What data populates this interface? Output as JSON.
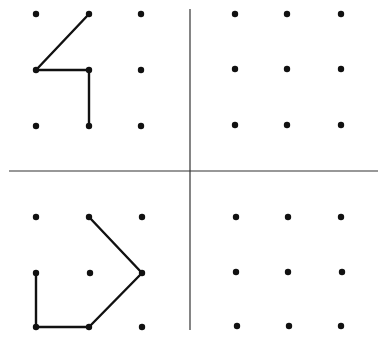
{
  "diagram": {
    "colors": {
      "ink": "#111111",
      "divider": "#333333",
      "background": "#ffffff"
    },
    "dividers": {
      "horizontal": {
        "x1": 9,
        "y": 171,
        "x2": 378
      },
      "vertical": {
        "x": 190,
        "y1": 9,
        "y2": 330
      }
    },
    "quadrants": [
      {
        "id": "top-left",
        "dots": [
          [
            36,
            14
          ],
          [
            89,
            14
          ],
          [
            141,
            14
          ],
          [
            36,
            70
          ],
          [
            89,
            70
          ],
          [
            141,
            70
          ],
          [
            36,
            126
          ],
          [
            89,
            126
          ],
          [
            141,
            126
          ]
        ],
        "segments": [
          [
            89,
            14,
            36,
            70
          ],
          [
            36,
            70,
            89,
            70
          ],
          [
            89,
            70,
            89,
            126
          ]
        ]
      },
      {
        "id": "top-right",
        "dots": [
          [
            235,
            14
          ],
          [
            287,
            14
          ],
          [
            341,
            14
          ],
          [
            235,
            69
          ],
          [
            287,
            69
          ],
          [
            341,
            69
          ],
          [
            235,
            125
          ],
          [
            287,
            125
          ],
          [
            341,
            125
          ]
        ],
        "segments": []
      },
      {
        "id": "bottom-left",
        "dots": [
          [
            36,
            217
          ],
          [
            89,
            217
          ],
          [
            142,
            217
          ],
          [
            36,
            273
          ],
          [
            90,
            273
          ],
          [
            142,
            273
          ],
          [
            36,
            327
          ],
          [
            89,
            327
          ],
          [
            142,
            327
          ]
        ],
        "segments": [
          [
            89,
            217,
            142,
            273
          ],
          [
            142,
            273,
            89,
            327
          ],
          [
            89,
            327,
            36,
            327
          ],
          [
            36,
            327,
            36,
            273
          ]
        ]
      },
      {
        "id": "bottom-right",
        "dots": [
          [
            236,
            217
          ],
          [
            288,
            217
          ],
          [
            341,
            217
          ],
          [
            236,
            272
          ],
          [
            288,
            272
          ],
          [
            342,
            272
          ],
          [
            237,
            326
          ],
          [
            289,
            326
          ],
          [
            341,
            326
          ]
        ],
        "segments": []
      }
    ]
  }
}
